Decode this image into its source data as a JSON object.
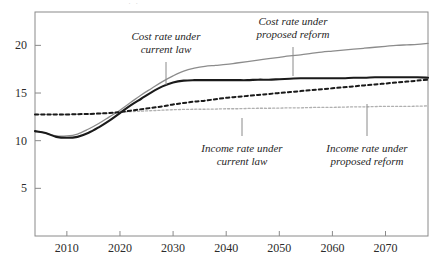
{
  "chart_data": {
    "type": "line",
    "title": "",
    "xlabel": "",
    "ylabel": "",
    "xlim": [
      2004,
      2078
    ],
    "ylim": [
      0,
      23.5
    ],
    "grid": false,
    "legend_position": "inline-annotations",
    "xticks": [
      "2010",
      "2020",
      "2030",
      "2040",
      "2050",
      "2060",
      "2070"
    ],
    "xtick_values": [
      2010,
      2020,
      2030,
      2040,
      2050,
      2060,
      2070
    ],
    "yticks": [
      "5",
      "10",
      "15",
      "20"
    ],
    "ytick_values": [
      5,
      10,
      15,
      20
    ],
    "x": [
      2004,
      2006,
      2008,
      2010,
      2012,
      2014,
      2016,
      2018,
      2020,
      2022,
      2024,
      2026,
      2028,
      2030,
      2032,
      2034,
      2036,
      2038,
      2040,
      2042,
      2044,
      2046,
      2048,
      2050,
      2052,
      2054,
      2056,
      2058,
      2060,
      2062,
      2064,
      2066,
      2068,
      2070,
      2072,
      2074,
      2076,
      2078
    ],
    "series": [
      {
        "name": "Cost rate under current law",
        "style": "solid",
        "color": "#1a1a1a",
        "width": 2.1,
        "values": [
          11.0,
          10.8,
          10.4,
          10.3,
          10.4,
          10.8,
          11.4,
          12.1,
          12.9,
          13.7,
          14.4,
          15.1,
          15.7,
          16.1,
          16.3,
          16.35,
          16.35,
          16.35,
          16.35,
          16.35,
          16.35,
          16.4,
          16.4,
          16.45,
          16.5,
          16.55,
          16.55,
          16.55,
          16.55,
          16.55,
          16.6,
          16.6,
          16.65,
          16.65,
          16.65,
          16.65,
          16.65,
          16.6
        ]
      },
      {
        "name": "Cost rate under proposed reform",
        "style": "solid",
        "color": "#8c8c8c",
        "width": 1.3,
        "values": [
          11.0,
          10.8,
          10.5,
          10.5,
          10.7,
          11.2,
          11.8,
          12.5,
          13.2,
          14.0,
          14.8,
          15.5,
          16.2,
          16.8,
          17.3,
          17.6,
          17.8,
          17.9,
          18.0,
          18.15,
          18.3,
          18.45,
          18.6,
          18.75,
          18.9,
          19.0,
          19.15,
          19.3,
          19.4,
          19.5,
          19.6,
          19.7,
          19.8,
          19.9,
          20.0,
          20.05,
          20.1,
          20.2
        ]
      },
      {
        "name": "Income rate under proposed reform",
        "style": "dashed",
        "color": "#1a1a1a",
        "width": 2.0,
        "values": [
          12.75,
          12.75,
          12.75,
          12.75,
          12.78,
          12.8,
          12.85,
          12.9,
          13.0,
          13.15,
          13.3,
          13.45,
          13.6,
          13.8,
          13.95,
          14.1,
          14.2,
          14.35,
          14.5,
          14.6,
          14.7,
          14.8,
          14.9,
          15.0,
          15.1,
          15.2,
          15.3,
          15.4,
          15.5,
          15.6,
          15.7,
          15.8,
          15.9,
          16.0,
          16.1,
          16.2,
          16.3,
          16.4
        ]
      },
      {
        "name": "Income rate under current law",
        "style": "dashed",
        "color": "#b0b0b0",
        "width": 1.3,
        "values": [
          12.75,
          12.75,
          12.75,
          12.75,
          12.78,
          12.8,
          12.85,
          12.9,
          13.0,
          13.05,
          13.1,
          13.15,
          13.2,
          13.25,
          13.28,
          13.3,
          13.3,
          13.32,
          13.35,
          13.35,
          13.38,
          13.4,
          13.4,
          13.42,
          13.45,
          13.45,
          13.48,
          13.5,
          13.5,
          13.52,
          13.55,
          13.55,
          13.58,
          13.6,
          13.6,
          13.6,
          13.62,
          13.65
        ]
      }
    ],
    "annotations": [
      {
        "id": "cost-current-law",
        "line1": "Cost rate under",
        "line2": "current law",
        "text_x": 166,
        "text_y": 40,
        "leader_x": 166,
        "leader_y1": 62,
        "leader_y2": 85
      },
      {
        "id": "cost-proposed-reform",
        "line1": "Cost rate under",
        "line2": "proposed reform",
        "text_x": 293,
        "text_y": 25,
        "leader_x": 293,
        "leader_y1": 47,
        "leader_y2": 76
      },
      {
        "id": "income-current-law",
        "line1": "Income rate under",
        "line2": "current law",
        "text_x": 242,
        "text_y": 152,
        "leader_x": 242,
        "leader_y1": 118,
        "leader_y2": 136
      },
      {
        "id": "income-proposed-reform",
        "line1": "Income rate under",
        "line2": "proposed reform",
        "text_x": 367,
        "text_y": 152,
        "leader_x": 367,
        "leader_y1": 104,
        "leader_y2": 136
      }
    ]
  },
  "plot": {
    "left": 35,
    "right": 428,
    "top": 12,
    "bottom": 236,
    "frame_color": "#8a8a8a"
  },
  "top_fragment": "· ·"
}
